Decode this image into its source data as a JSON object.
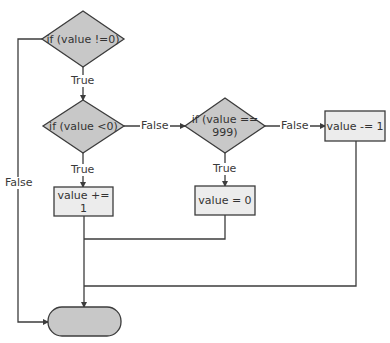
{
  "diagram": {
    "type": "flowchart",
    "colors": {
      "decision_fill": "#c8c8c8",
      "process_fill": "#ececec",
      "terminal_fill": "#c8c8c8",
      "stroke": "#3c3c3c",
      "background": "#ffffff"
    },
    "nodes": {
      "decision1": {
        "label": "if (value !=0)"
      },
      "decision2": {
        "label": "if (value <0)"
      },
      "decision3": {
        "label_line1": "if (value ==",
        "label_line2": "999)"
      },
      "process_inc": {
        "label": "value += 1"
      },
      "process_zero": {
        "label": "value = 0"
      },
      "process_dec": {
        "label": "value -= 1"
      },
      "terminal": {
        "label": ""
      }
    },
    "edges": {
      "d1_true": "True",
      "d1_false": "False",
      "d2_true": "True",
      "d2_false": "False",
      "d3_true": "True",
      "d3_false": "False"
    }
  }
}
